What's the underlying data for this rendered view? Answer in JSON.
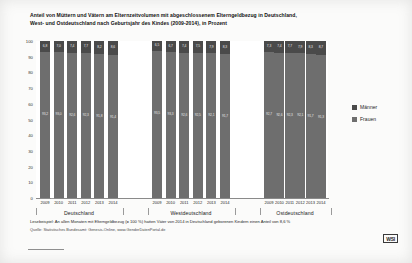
{
  "title": {
    "line1": "Anteil von Müttern und Vätern am Elternzeitvolumen mit abgeschlossenem Elterngeldbezug in Deutschland,",
    "line2": "West- und Ostdeutschland nach Geburtsjahr des Kindes (2009-2014), in Prozent"
  },
  "legend": {
    "maenner": "Männer",
    "frauen": "Frauen"
  },
  "footnote": "Lesebeispiel: An allen Monaten mit Elterngeldbezug (= 100 %) hatten Väter von 2014 in Deutschland geborenen Kindern einen Anteil von 8,6 %",
  "source": "Quelle: Statistisches Bundesamt: Genesis-Online, www.GenderDatenPortal.de",
  "logo": "WSI",
  "colors": {
    "maenner": "#4a4a4a",
    "frauen": "#6e6e6e",
    "axis": "#8a8a8a",
    "background": "#ffffff"
  },
  "groups": [
    {
      "label": "Deutschland"
    },
    {
      "label": "Westdeutschland"
    },
    {
      "label": "Ostdeutschland"
    }
  ],
  "yticks": [
    "100",
    "90",
    "80",
    "70",
    "60",
    "50",
    "40",
    "30",
    "20",
    "10",
    "0"
  ],
  "chart_data": {
    "type": "bar",
    "stacked": true,
    "orientation": "vertical",
    "title": "Anteil von Müttern und Vätern am Elternzeitvolumen mit abgeschlossenem Elterngeldbezug in Deutschland, West- und Ostdeutschland nach Geburtsjahr des Kindes (2009-2014), in Prozent",
    "xlabel": "",
    "ylabel": "Prozent",
    "ylim": [
      0,
      100
    ],
    "ytick_step": 10,
    "grid": false,
    "legend_position": "right",
    "categories": [
      "2009",
      "2010",
      "2011",
      "2012",
      "2013",
      "2014"
    ],
    "groups": [
      "Deutschland",
      "Westdeutschland",
      "Ostdeutschland"
    ],
    "series": [
      {
        "name": "Männer",
        "color": "#4a4a4a",
        "values_by_group": {
          "Deutschland": [
            6.8,
            7.0,
            7.4,
            7.7,
            8.2,
            8.6
          ],
          "Westdeutschland": [
            6.5,
            6.7,
            7.4,
            7.5,
            7.9,
            8.3
          ],
          "Ostdeutschland": [
            7.3,
            7.4,
            7.7,
            7.9,
            8.3,
            8.7
          ]
        }
      },
      {
        "name": "Frauen",
        "color": "#6e6e6e",
        "values_by_group": {
          "Deutschland": [
            93.2,
            93.0,
            92.6,
            92.3,
            91.8,
            91.4
          ],
          "Westdeutschland": [
            93.5,
            93.3,
            92.6,
            92.5,
            92.1,
            91.7
          ],
          "Ostdeutschland": [
            92.7,
            92.6,
            92.3,
            92.1,
            91.7,
            91.3
          ]
        }
      }
    ],
    "bar_labels": {
      "Deutschland": {
        "Männer": [
          "6,8",
          "7,0",
          "7,4",
          "7,7",
          "8,2",
          "8,6"
        ],
        "Frauen": [
          "93,2",
          "93,0",
          "92,6",
          "92,3",
          "91,8",
          "91,4"
        ]
      },
      "Westdeutschland": {
        "Männer": [
          "6,5",
          "6,7",
          "7,4",
          "7,5",
          "7,9",
          "8,3"
        ],
        "Frauen": [
          "93,5",
          "93,3",
          "92,6",
          "92,5",
          "92,1",
          "91,7"
        ]
      },
      "Ostdeutschland": {
        "Männer": [
          "7,3",
          "7,4",
          "7,7",
          "7,9",
          "8,3",
          "8,7"
        ],
        "Frauen": [
          "92,7",
          "92,6",
          "92,3",
          "92,1",
          "91,7",
          "91,3"
        ]
      }
    }
  }
}
